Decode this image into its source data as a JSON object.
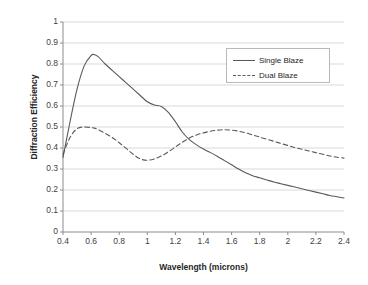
{
  "chart_data": {
    "type": "line",
    "title": "",
    "xlabel": "Wavelength (microns)",
    "ylabel": "Diffraction Efficiency",
    "xlim": [
      0.4,
      2.4
    ],
    "ylim": [
      0,
      1
    ],
    "xticks": [
      "0.4",
      "0.6",
      "0.8",
      "1",
      "1.2",
      "1.4",
      "1.6",
      "1.8",
      "2",
      "2.2",
      "2.4"
    ],
    "xtick_values": [
      0.4,
      0.6,
      0.8,
      1.0,
      1.2,
      1.4,
      1.6,
      1.8,
      2.0,
      2.2,
      2.4
    ],
    "yticks": [
      "0",
      "0.1",
      "0.2",
      "0.3",
      "0.4",
      "0.5",
      "0.6",
      "0.7",
      "0.8",
      "0.9",
      "1"
    ],
    "ytick_values": [
      0,
      0.1,
      0.2,
      0.3,
      0.4,
      0.5,
      0.6,
      0.7,
      0.8,
      0.9,
      1.0
    ],
    "grid": "horizontal",
    "legend_position": "upper-right-inside",
    "line_color": "#595959",
    "grid_color": "#d9d9d9",
    "axis_color": "#8c8c8c",
    "x": [
      0.4,
      0.45,
      0.5,
      0.55,
      0.6,
      0.62,
      0.65,
      0.7,
      0.75,
      0.8,
      0.85,
      0.9,
      0.95,
      1.0,
      1.05,
      1.1,
      1.15,
      1.2,
      1.25,
      1.3,
      1.35,
      1.4,
      1.45,
      1.5,
      1.55,
      1.6,
      1.65,
      1.7,
      1.75,
      1.8,
      1.85,
      1.9,
      1.95,
      2.0,
      2.05,
      2.1,
      2.15,
      2.2,
      2.25,
      2.3,
      2.35,
      2.4
    ],
    "series": [
      {
        "name": "Single Blaze",
        "style": "solid",
        "values": [
          0.355,
          0.525,
          0.68,
          0.79,
          0.84,
          0.845,
          0.835,
          0.8,
          0.77,
          0.74,
          0.71,
          0.68,
          0.65,
          0.62,
          0.605,
          0.598,
          0.57,
          0.525,
          0.475,
          0.44,
          0.415,
          0.395,
          0.378,
          0.36,
          0.34,
          0.32,
          0.3,
          0.282,
          0.268,
          0.258,
          0.248,
          0.238,
          0.23,
          0.222,
          0.214,
          0.206,
          0.198,
          0.19,
          0.182,
          0.174,
          0.168,
          0.162
        ]
      },
      {
        "name": "Dual Blaze",
        "style": "dashed",
        "values": [
          0.37,
          0.45,
          0.492,
          0.5,
          0.497,
          0.495,
          0.488,
          0.47,
          0.45,
          0.425,
          0.398,
          0.37,
          0.348,
          0.342,
          0.348,
          0.362,
          0.382,
          0.405,
          0.428,
          0.448,
          0.462,
          0.472,
          0.48,
          0.485,
          0.487,
          0.485,
          0.48,
          0.472,
          0.462,
          0.452,
          0.442,
          0.432,
          0.422,
          0.412,
          0.402,
          0.394,
          0.386,
          0.378,
          0.37,
          0.362,
          0.356,
          0.352
        ]
      }
    ]
  },
  "legend": {
    "items": [
      {
        "label": "Single Blaze"
      },
      {
        "label": "Dual Blaze"
      }
    ]
  }
}
